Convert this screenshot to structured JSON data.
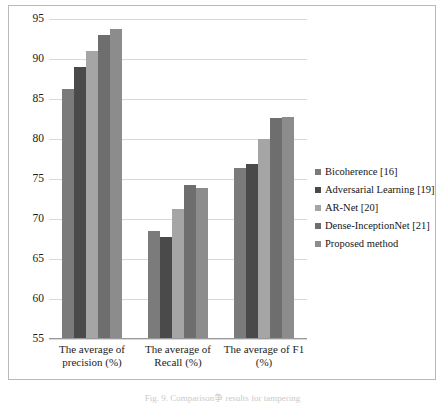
{
  "chart_data": {
    "type": "bar",
    "title": "",
    "xlabel": "",
    "ylabel": "",
    "ylim": [
      55,
      95
    ],
    "ytick_step": 5,
    "yticks": [
      "95",
      "90",
      "85",
      "80",
      "75",
      "70",
      "65",
      "60",
      "55"
    ],
    "grid": true,
    "legend_position": "right",
    "categories": [
      "The average of precision (%)",
      "The average of Recall (%)",
      "The average of F1 (%)"
    ],
    "series": [
      {
        "name": "Bicoherence [16]",
        "color": "#7b7b7b",
        "values": [
          86.3,
          68.5,
          76.4
        ]
      },
      {
        "name": "Adversarial Learning [19]",
        "color": "#4a4a4a",
        "values": [
          89.0,
          67.7,
          76.9
        ]
      },
      {
        "name": "AR-Net [20]",
        "color": "#a5a5a5",
        "values": [
          91.0,
          71.2,
          80.0
        ]
      },
      {
        "name": " Dense-InceptionNet [21]",
        "color": "#6e6e6e",
        "values": [
          93.0,
          74.3,
          82.6
        ]
      },
      {
        "name": "Proposed method",
        "color": "#8c8c8c",
        "values": [
          93.8,
          73.9,
          82.7
        ]
      }
    ]
  },
  "caption": "Fig. 9.  Comparison争 results for tampering"
}
